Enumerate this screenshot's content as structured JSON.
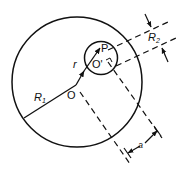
{
  "diagram": {
    "labels": {
      "R1": "R",
      "R1_sub": "1",
      "R2": "R",
      "R2_sub": "2",
      "r": "r",
      "P": "P",
      "O": "O",
      "O_prime": "O'",
      "a": "a"
    },
    "colors": {
      "stroke": "#111111",
      "background": "#ffffff"
    }
  }
}
